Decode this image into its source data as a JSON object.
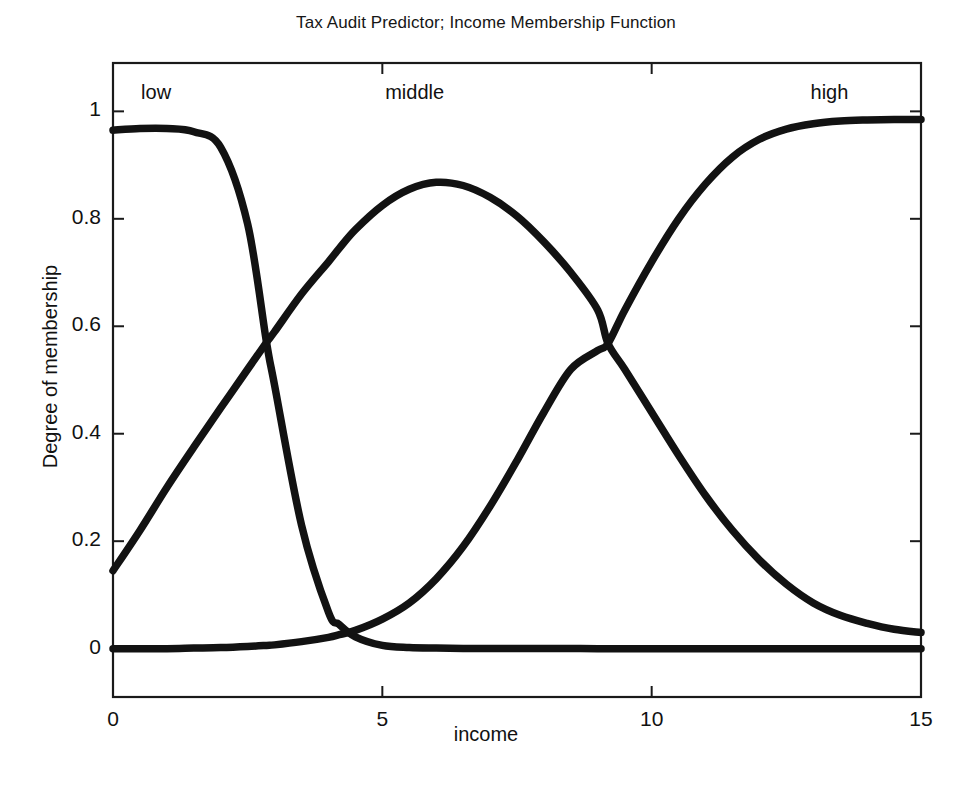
{
  "chart_data": {
    "type": "line",
    "title": "Tax Audit Predictor; Income Membership Function",
    "xlabel": "income",
    "ylabel": "Degree of membership",
    "xlim": [
      0,
      15
    ],
    "ylim": [
      0,
      1
    ],
    "axis_box_ylim": [
      -0.09,
      1.09
    ],
    "grid": false,
    "legend": "in-plot annotations",
    "xticks": [
      0,
      5,
      10,
      15
    ],
    "xticklabels": [
      "0",
      "5",
      "10",
      "15"
    ],
    "yticks": [
      0,
      0.2,
      0.4,
      0.6,
      0.8,
      1
    ],
    "yticklabels": [
      "0",
      "0.2",
      "0.4",
      "0.6",
      "0.8",
      "1"
    ],
    "annotations": [
      {
        "text": "low",
        "x": 0.8,
        "y": 1.03
      },
      {
        "text": "middle",
        "x": 5.6,
        "y": 1.03
      },
      {
        "text": "high",
        "x": 13.3,
        "y": 1.03
      }
    ],
    "x": [
      0,
      0.5,
      1,
      1.5,
      2,
      2.5,
      2.85,
      3,
      3.5,
      4,
      4.2,
      4.5,
      5,
      5.5,
      6,
      6.5,
      7,
      7.5,
      8,
      8.5,
      9,
      9.19,
      9.5,
      10,
      10.5,
      11,
      11.5,
      12,
      12.5,
      13,
      13.5,
      14,
      14.5,
      15
    ],
    "series": [
      {
        "name": "low",
        "label": "low",
        "color": "#121212",
        "values": [
          0.965,
          0.968,
          0.968,
          0.962,
          0.933,
          0.79,
          0.57,
          0.49,
          0.23,
          0.068,
          0.045,
          0.022,
          0.006,
          0.002,
          0.001,
          0.0005,
          0.0003,
          0.0002,
          0.0001,
          0.0001,
          0,
          0,
          0,
          0,
          0,
          0,
          0,
          0,
          0,
          0,
          0,
          0,
          0,
          0
        ]
      },
      {
        "name": "middle",
        "label": "middle",
        "color": "#121212",
        "values": [
          0.145,
          0.22,
          0.3,
          0.375,
          0.448,
          0.52,
          0.57,
          0.59,
          0.66,
          0.72,
          0.745,
          0.78,
          0.825,
          0.855,
          0.868,
          0.862,
          0.84,
          0.805,
          0.757,
          0.7,
          0.63,
          0.568,
          0.52,
          0.44,
          0.36,
          0.285,
          0.22,
          0.165,
          0.12,
          0.085,
          0.062,
          0.047,
          0.036,
          0.03
        ]
      },
      {
        "name": "high",
        "label": "high",
        "color": "#121212",
        "values": [
          0.0,
          0.0,
          0.0,
          0.001,
          0.002,
          0.004,
          0.006,
          0.007,
          0.013,
          0.021,
          0.026,
          0.034,
          0.055,
          0.085,
          0.13,
          0.19,
          0.265,
          0.35,
          0.44,
          0.52,
          0.555,
          0.568,
          0.63,
          0.72,
          0.8,
          0.865,
          0.915,
          0.948,
          0.967,
          0.977,
          0.982,
          0.984,
          0.985,
          0.985
        ]
      }
    ],
    "crossings": [
      {
        "series": [
          "low",
          "middle"
        ],
        "x": 2.85,
        "y": 0.57
      },
      {
        "series": [
          "middle",
          "high"
        ],
        "x": 9.19,
        "y": 0.568
      },
      {
        "series": [
          "low",
          "high"
        ],
        "x": 4.2,
        "y": 0.03
      }
    ]
  }
}
